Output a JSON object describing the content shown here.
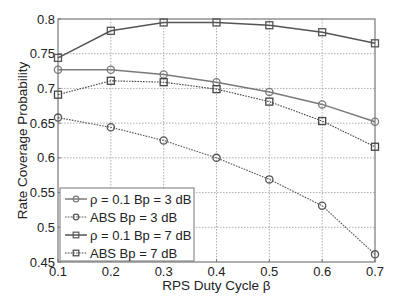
{
  "chart_data": {
    "type": "line",
    "title": "",
    "xlabel": "RPS Duty Cycle β",
    "ylabel": "Rate Coverage Probability",
    "xlim": [
      0.1,
      0.7
    ],
    "ylim": [
      0.45,
      0.8
    ],
    "x": [
      0.1,
      0.2,
      0.3,
      0.4,
      0.5,
      0.6,
      0.7
    ],
    "xticks": [
      "0.1",
      "0.2",
      "0.3",
      "0.4",
      "0.5",
      "0.6",
      "0.7"
    ],
    "yticks": [
      "0.45",
      "0.5",
      "0.55",
      "0.6",
      "0.65",
      "0.7",
      "0.75",
      "0.8"
    ],
    "ytick_values": [
      0.45,
      0.5,
      0.55,
      0.6,
      0.65,
      0.7,
      0.75,
      0.8
    ],
    "grid": true,
    "legend_position": "bottom-left",
    "series": [
      {
        "name": "ρ = 0.1 Bp = 3 dB",
        "marker": "circle",
        "line_style": "solid",
        "color": "#7a7a7a",
        "values": [
          0.727,
          0.727,
          0.72,
          0.709,
          0.695,
          0.677,
          0.652
        ]
      },
      {
        "name": "ABS Bp = 3 dB",
        "marker": "circle",
        "line_style": "dotted",
        "color": "#555555",
        "values": [
          0.658,
          0.644,
          0.625,
          0.6,
          0.569,
          0.531,
          0.461
        ]
      },
      {
        "name": "ρ = 0.1 Bp = 7 dB",
        "marker": "square",
        "line_style": "solid",
        "color": "#555555",
        "values": [
          0.744,
          0.783,
          0.795,
          0.795,
          0.791,
          0.781,
          0.765
        ]
      },
      {
        "name": "ABS Bp = 7 dB",
        "marker": "square",
        "line_style": "dotted",
        "color": "#444444",
        "values": [
          0.691,
          0.711,
          0.709,
          0.699,
          0.681,
          0.653,
          0.616
        ]
      }
    ]
  }
}
